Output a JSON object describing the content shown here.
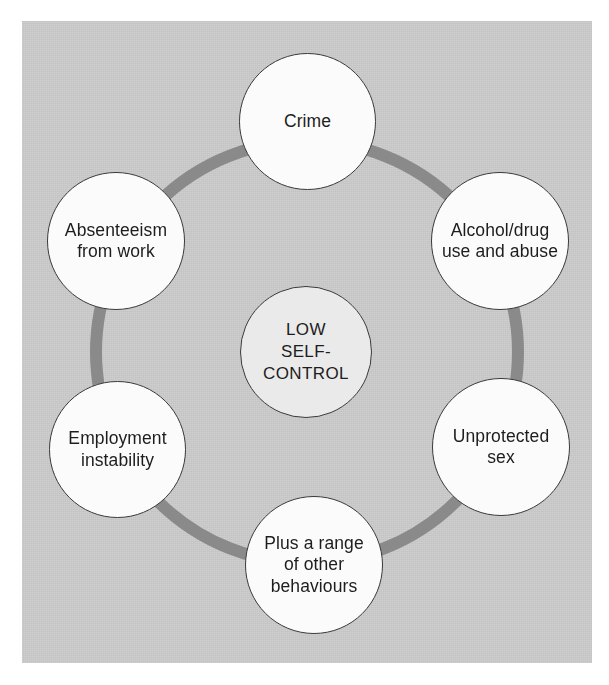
{
  "figure": {
    "center": {
      "id": "low-self-control",
      "label": "LOW\nSELF-\nCONTROL",
      "fill": "#eaeaea"
    },
    "background": {
      "panel_color": "#c7c7c7",
      "page_color": "#ffffff"
    },
    "ring": {
      "color": "#8a8a8a",
      "stroke_width": 12,
      "radius": 211,
      "center_x": 307,
      "center_y": 352
    },
    "nodes": [
      {
        "id": "crime",
        "label": "Crime",
        "position": "top",
        "fill": "#fbfbfb",
        "stroke": "#3a3a3a"
      },
      {
        "id": "alcohol-drug-use",
        "label": "Alcohol/drug\nuse and abuse",
        "position": "upper-right",
        "fill": "#fbfbfb",
        "stroke": "#3a3a3a"
      },
      {
        "id": "unprotected-sex",
        "label": "Unprotected\nsex",
        "position": "lower-right",
        "fill": "#fbfbfb",
        "stroke": "#3a3a3a"
      },
      {
        "id": "other-behaviours",
        "label": "Plus a range\nof other\nbehaviours",
        "position": "bottom",
        "fill": "#fbfbfb",
        "stroke": "#3a3a3a"
      },
      {
        "id": "employment-instability",
        "label": "Employment\ninstability",
        "position": "lower-left",
        "fill": "#fbfbfb",
        "stroke": "#3a3a3a"
      },
      {
        "id": "absenteeism-from-work",
        "label": "Absenteeism\nfrom work",
        "position": "upper-left",
        "fill": "#fbfbfb",
        "stroke": "#3a3a3a"
      }
    ]
  }
}
